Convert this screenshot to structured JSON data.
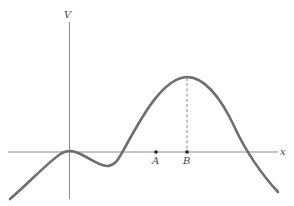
{
  "diagram": {
    "y_axis_label": "V",
    "x_axis_label": "x",
    "points": [
      {
        "label": "A"
      },
      {
        "label": "B"
      }
    ],
    "colors": {
      "curve": "#6e6e6e",
      "axis": "#8a8a8a",
      "point": "#222222"
    }
  }
}
